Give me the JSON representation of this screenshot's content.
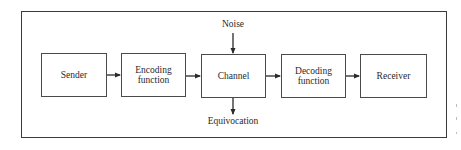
{
  "diagram": {
    "type": "flowchart",
    "nodes": [
      {
        "id": "sender",
        "label": "Sender"
      },
      {
        "id": "encoding",
        "label": "Encoding function",
        "lines": [
          "Encoding",
          "function"
        ]
      },
      {
        "id": "channel",
        "label": "Channel"
      },
      {
        "id": "decoding",
        "label": "Decoding function",
        "lines": [
          "Decoding",
          "function"
        ]
      },
      {
        "id": "receiver",
        "label": "Receiver"
      }
    ],
    "edges": [
      {
        "from": "sender",
        "to": "encoding"
      },
      {
        "from": "encoding",
        "to": "channel"
      },
      {
        "from": "channel",
        "to": "decoding"
      },
      {
        "from": "decoding",
        "to": "receiver"
      },
      {
        "from": "noise",
        "to": "channel"
      },
      {
        "from": "channel",
        "to": "equivocation"
      }
    ],
    "inputs": {
      "noise": "Noise"
    },
    "outputs": {
      "equivocation": "Equivocation"
    }
  }
}
